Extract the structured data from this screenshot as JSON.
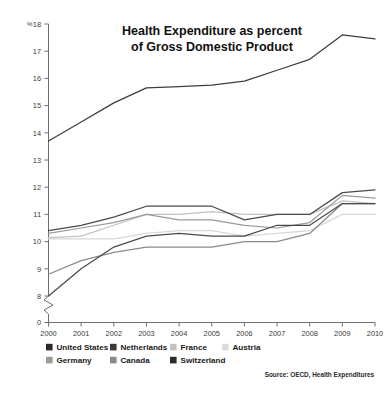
{
  "figure": {
    "title_line_1": "Health Expenditure as percent",
    "title_line_2": "of Gross Domestic Product",
    "source": "Source: OECD, Health Expenditures",
    "y_unit": "%",
    "background": "#ffffff"
  },
  "chart_data": {
    "type": "line",
    "title": "Health Expenditure as percent of Gross Domestic Product",
    "xlabel": "",
    "ylabel": "%",
    "x": [
      2000,
      2001,
      2002,
      2003,
      2004,
      2005,
      2006,
      2007,
      2008,
      2009,
      2010
    ],
    "xtick_labels": [
      "2000",
      "2001",
      "2002",
      "2003",
      "2004",
      "2005",
      "2006",
      "2007",
      "2008",
      "2009",
      "2010"
    ],
    "ytick_labels": [
      "0",
      "8",
      "9",
      "10",
      "11",
      "12",
      "13",
      "14",
      "15",
      "16",
      "17",
      "18"
    ],
    "ylim": [
      8,
      18
    ],
    "y_axis_break": true,
    "y_axis_break_note": "axis broken between 0 and 8",
    "grid": false,
    "legend_position": "below-plot",
    "series": [
      {
        "name": "United States",
        "color": "#3d3d3d",
        "values": [
          13.7,
          14.4,
          15.1,
          15.65,
          15.7,
          15.75,
          15.9,
          16.3,
          16.7,
          17.6,
          17.45
        ]
      },
      {
        "name": "Netherlands",
        "color": "#4a4a4a",
        "values": [
          10.4,
          10.6,
          10.9,
          11.3,
          11.3,
          11.3,
          10.8,
          11.0,
          11.0,
          11.8,
          11.9
        ]
      },
      {
        "name": "France",
        "color": "#c2c2c2",
        "values": [
          10.15,
          10.2,
          10.6,
          11.0,
          11.0,
          11.1,
          11.0,
          11.0,
          11.0,
          11.5,
          11.4
        ]
      },
      {
        "name": "Austria",
        "color": "#d8d8d8",
        "values": [
          10.1,
          10.1,
          10.1,
          10.3,
          10.4,
          10.4,
          10.2,
          10.3,
          10.4,
          11.0,
          11.0
        ]
      },
      {
        "name": "Germany",
        "color": "#9a9a9a",
        "values": [
          10.3,
          10.5,
          10.7,
          11.0,
          10.8,
          10.8,
          10.6,
          10.5,
          10.7,
          11.7,
          11.6
        ]
      },
      {
        "name": "Canada",
        "color": "#8a8a8a",
        "values": [
          8.8,
          9.3,
          9.6,
          9.8,
          9.8,
          9.8,
          10.0,
          10.0,
          10.3,
          11.4,
          11.4
        ]
      },
      {
        "name": "Switzerland",
        "color": "#4a4a4a",
        "values": [
          8.0,
          9.0,
          9.8,
          10.2,
          10.3,
          10.2,
          10.2,
          10.6,
          10.6,
          11.4,
          11.4
        ]
      }
    ],
    "legend": [
      {
        "label": "United States",
        "color": "#2b2b2b"
      },
      {
        "label": "Netherlands",
        "color": "#3a3a3a"
      },
      {
        "label": "France",
        "color": "#c2c2c2"
      },
      {
        "label": "Austria",
        "color": "#dcdcdc"
      },
      {
        "label": "Germany",
        "color": "#9a9a9a"
      },
      {
        "label": "Canada",
        "color": "#8a8a8a"
      },
      {
        "label": "Switzerland",
        "color": "#2b2b2b"
      }
    ]
  }
}
